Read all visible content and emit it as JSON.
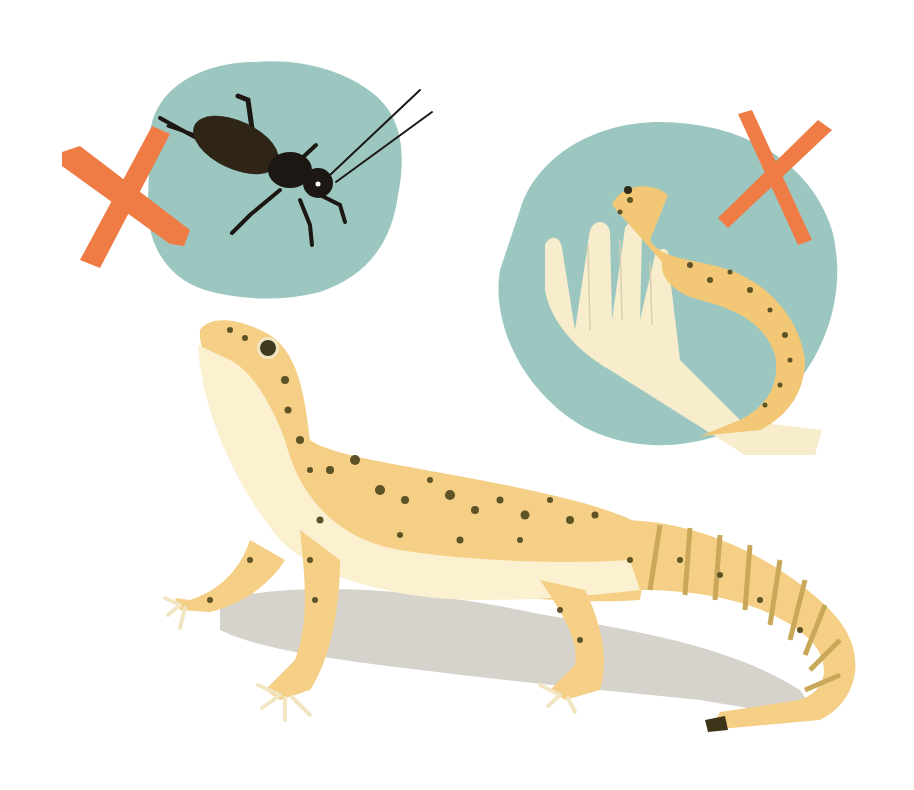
{
  "illustration": {
    "subject": "Leopard gecko care illustration",
    "panels": [
      {
        "name": "cricket-panel",
        "depicts": "cricket on teal blob with orange X"
      },
      {
        "name": "hand-panel",
        "depicts": "gecko held in hand on teal blob with orange X"
      },
      {
        "name": "main-gecko",
        "depicts": "leopard gecko standing, looking up"
      }
    ]
  },
  "colors": {
    "background": "#ffffff",
    "teal_blob": "#9cc7c1",
    "x_mark": "#ef7b45",
    "gecko_body": "#f6cf86",
    "gecko_belly": "#fbf0d0",
    "gecko_spots": "#5d5326",
    "tail_bands": "#c9a85a",
    "shadow": "#d6d3cc",
    "cricket": "#1c1712",
    "hand": "#f7edcc"
  }
}
